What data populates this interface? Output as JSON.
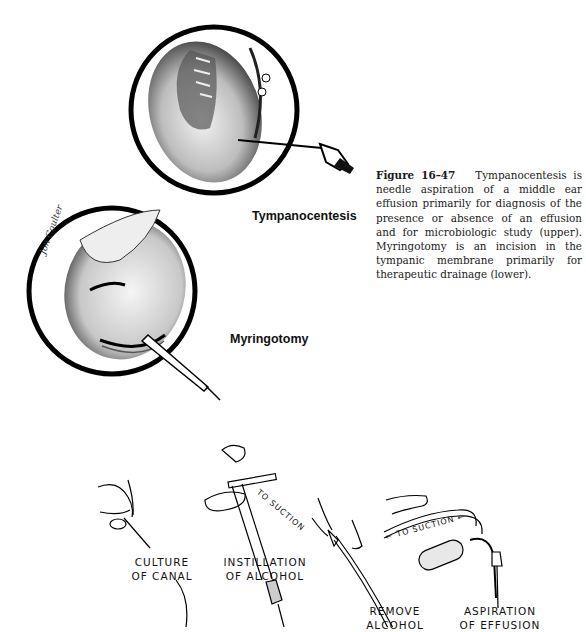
{
  "figure": {
    "number": "Figure 16–47",
    "caption": "Tympanocentesis is needle aspiration of a middle ear effusion primarily for diagnosis of the presence or absence of an effusion and for microbiologic study (upper). Myringotomy is an incision in the tympanic membrane primarily for therapeutic drainage (lower)."
  },
  "upper_illustration": {
    "label": "Tympanocentesis"
  },
  "lower_illustration": {
    "label": "Myringotomy"
  },
  "steps": [
    {
      "line1": "CULTURE",
      "line2": "OF CANAL"
    },
    {
      "line1": "INSTILLATION",
      "line2": "OF ALCOHOL"
    },
    {
      "line1": "REMOVE",
      "line2": "ALCOHOL"
    },
    {
      "line1": "ASPIRATION",
      "line2": "OF EFFUSION"
    }
  ],
  "annotations": {
    "to_suction_1": "TO SUCTION",
    "to_suction_2": "← TO SUCTION ←"
  }
}
